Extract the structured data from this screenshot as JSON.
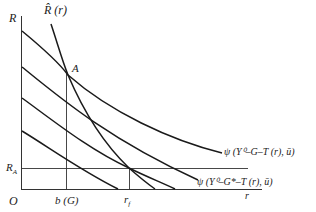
{
  "diagram": {
    "axes": {
      "y_label": "R",
      "x_label": "r",
      "origin_label": "O"
    },
    "labels": {
      "rhat_curve": "R̂ (r)",
      "point_a": "A",
      "r_a": "R",
      "r_a_sub": "A",
      "b_g": "b (G)",
      "r_f": "r",
      "r_f_sub": "f",
      "psi_upper": "ψ (Y⁰–G–T (r), ū)",
      "psi_lower": "ψ (Y⁰–G*–T (r), ū)"
    },
    "colors": {
      "line": "#1a1a1a",
      "background": "#ffffff"
    }
  }
}
